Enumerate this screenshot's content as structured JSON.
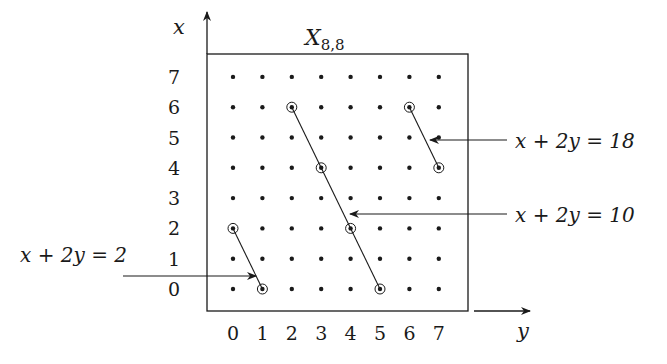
{
  "figure": {
    "title": "X",
    "title_subscript": "8,8",
    "x_axis_label": "x",
    "y_axis_label": "y",
    "row_ticks": [
      "0",
      "1",
      "2",
      "3",
      "4",
      "5",
      "6",
      "7"
    ],
    "col_ticks": [
      "0",
      "1",
      "2",
      "3",
      "4",
      "5",
      "6",
      "7"
    ],
    "grid_size": [
      8,
      8
    ],
    "lines": [
      {
        "equation": "x + 2y = 2",
        "label": "x + 2y = 2",
        "points": [
          [
            2,
            0
          ],
          [
            0,
            1
          ]
        ],
        "label_side": "left"
      },
      {
        "equation": "x + 2y = 10",
        "label": "x + 2y = 10",
        "points": [
          [
            6,
            2
          ],
          [
            4,
            3
          ],
          [
            2,
            4
          ],
          [
            0,
            5
          ]
        ],
        "label_side": "right"
      },
      {
        "equation": "x + 2y = 18",
        "label": "x + 2y = 18",
        "points": [
          [
            6,
            6
          ],
          [
            4,
            7
          ]
        ],
        "label_side": "right"
      }
    ],
    "colors": {
      "ink": "#1a1a1a",
      "background": "#ffffff"
    }
  }
}
